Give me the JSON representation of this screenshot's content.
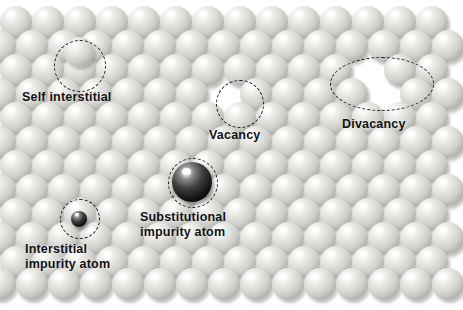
{
  "figure": {
    "background_color": "#ffffff",
    "width": 463,
    "height": 310
  },
  "labels": [
    {
      "id": "self-interstitial",
      "text": "Self interstitial",
      "x": 22,
      "y": 90,
      "font_size": 12.5
    },
    {
      "id": "vacancy",
      "text": "Vacancy",
      "x": 209,
      "y": 128,
      "font_size": 12.5
    },
    {
      "id": "divacancy",
      "text": "Divacancy",
      "x": 342,
      "y": 117,
      "font_size": 12.5
    },
    {
      "id": "substitutional-impurity",
      "text": "Substitutional\nimpurity atom",
      "x": 140,
      "y": 210,
      "font_size": 12.5
    },
    {
      "id": "interstitial-impurity",
      "text": "Interstitial\nimpurity atom",
      "x": 25,
      "y": 242,
      "font_size": 12.5
    }
  ],
  "markers": [
    {
      "id": "self-interstitial-marker",
      "shape": "circle",
      "cx": 79,
      "cy": 65,
      "rx": 25,
      "ry": 25,
      "color": "#1b1b1b"
    },
    {
      "id": "vacancy-marker",
      "shape": "circle",
      "cx": 239,
      "cy": 103,
      "rx": 23,
      "ry": 23,
      "color": "#1b1b1b"
    },
    {
      "id": "divacancy-marker",
      "shape": "ellipse",
      "cx": 381,
      "cy": 83,
      "rx": 51,
      "ry": 26,
      "color": "#1b1b1b"
    },
    {
      "id": "substitutional-impurity-marker",
      "shape": "circle",
      "cx": 192,
      "cy": 182,
      "rx": 24,
      "ry": 24,
      "color": "#1b1b1b"
    },
    {
      "id": "interstitial-impurity-marker",
      "shape": "circle",
      "cx": 79,
      "cy": 218,
      "rx": 19,
      "ry": 19,
      "color": "#1b1b1b"
    }
  ],
  "defect_atoms": [
    {
      "id": "substitutional-impurity-atom",
      "cx": 192,
      "cy": 182,
      "r": 20,
      "color": "#101010",
      "kind": "dark"
    },
    {
      "id": "interstitial-impurity-atom",
      "cx": 79,
      "cy": 219,
      "r": 8,
      "color": "#1a1a1a",
      "kind": "dark"
    }
  ],
  "lattice": {
    "atom_radius": 16,
    "column_spacing": 32,
    "row_spacing": 24.5,
    "row_offset": 16,
    "rows": [
      {
        "y": 22,
        "offset": 16,
        "count": 14,
        "start_x": 16
      },
      {
        "y": 46,
        "offset": 0,
        "count": 15,
        "start_x": 0
      },
      {
        "y": 70,
        "offset": 16,
        "count": 14,
        "start_x": 16
      },
      {
        "y": 94,
        "offset": 0,
        "count": 15,
        "start_x": 0
      },
      {
        "y": 118,
        "offset": 16,
        "count": 14,
        "start_x": 16
      },
      {
        "y": 142,
        "offset": 0,
        "count": 15,
        "start_x": 0
      },
      {
        "y": 166,
        "offset": 16,
        "count": 14,
        "start_x": 16
      },
      {
        "y": 190,
        "offset": 0,
        "count": 15,
        "start_x": 0
      },
      {
        "y": 214,
        "offset": 16,
        "count": 14,
        "start_x": 16
      },
      {
        "y": 238,
        "offset": 0,
        "count": 15,
        "start_x": 0
      },
      {
        "y": 262,
        "offset": 16,
        "count": 14,
        "start_x": 16
      },
      {
        "y": 284,
        "offset": 0,
        "count": 15,
        "start_x": 0
      }
    ],
    "vacancies": [
      {
        "row": 3,
        "col": 7
      },
      {
        "row": 2,
        "col": 11
      },
      {
        "row": 3,
        "col": 12
      }
    ],
    "extra_atoms": [
      {
        "cx": 79,
        "cy": 52,
        "r": 15
      }
    ]
  }
}
